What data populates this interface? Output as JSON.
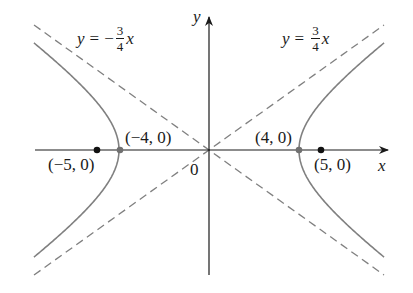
{
  "figure": {
    "type": "hyperbola-diagram",
    "equation": "x^2/16 - y^2/9 = 1",
    "colors": {
      "axis": "#1a1a1a",
      "curve": "#808080",
      "asymptote": "#808080",
      "focus_point": "#111111",
      "vertex_point": "#707070",
      "text": "#1a1a1a"
    },
    "pixel_mapping": {
      "origin_x": 209,
      "origin_y": 150,
      "x_scale": 22.5,
      "y_scale": 21.4
    }
  },
  "axes": {
    "x_label": "x",
    "y_label": "y",
    "origin_label": "0"
  },
  "asymptotes": [
    {
      "label_y": "y",
      "label_eq": "=",
      "label_sign": "−",
      "label_num": "3",
      "label_den": "4",
      "label_x": "x",
      "slope": -0.75
    },
    {
      "label_y": "y",
      "label_eq": "=",
      "label_sign": "",
      "label_num": "3",
      "label_den": "4",
      "label_x": "x",
      "slope": 0.75
    }
  ],
  "points": {
    "left_focus": {
      "label": "(−5, 0)",
      "x": -5,
      "y": 0
    },
    "left_vertex": {
      "label": "(−4, 0)",
      "x": -4,
      "y": 0
    },
    "right_vertex": {
      "label": "(4, 0)",
      "x": 4,
      "y": 0
    },
    "right_focus": {
      "label": "(5, 0)",
      "x": 5,
      "y": 0
    }
  },
  "chart_data": {
    "type": "line",
    "title": "",
    "xlabel": "x",
    "ylabel": "y",
    "series": [
      {
        "name": "hyperbola x²/16 − y²/9 = 1 (right branch)",
        "a": 4,
        "b": 3,
        "x_range": [
          4,
          7.78
        ]
      },
      {
        "name": "hyperbola x²/16 − y²/9 = 1 (left branch)",
        "a": 4,
        "b": 3,
        "x_range": [
          -7.78,
          -4
        ]
      },
      {
        "name": "asymptote y = (3/4)x",
        "style": "dashed",
        "x_range": [
          -7.78,
          7.78
        ]
      },
      {
        "name": "asymptote y = −(3/4)x",
        "style": "dashed",
        "x_range": [
          -7.78,
          7.78
        ]
      }
    ],
    "points": [
      {
        "label": "(−5, 0)",
        "x": -5,
        "y": 0,
        "kind": "focus"
      },
      {
        "label": "(−4, 0)",
        "x": -4,
        "y": 0,
        "kind": "vertex"
      },
      {
        "label": "(4, 0)",
        "x": 4,
        "y": 0,
        "kind": "vertex"
      },
      {
        "label": "(5, 0)",
        "x": 5,
        "y": 0,
        "kind": "focus"
      }
    ],
    "annotations": [
      "y = −(3/4)x",
      "y = (3/4)x",
      "0"
    ],
    "grid": false
  }
}
